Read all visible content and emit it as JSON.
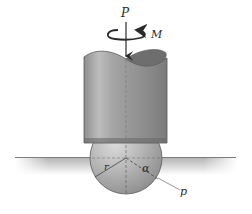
{
  "figure": {
    "labels": {
      "force": "P",
      "moment": "M",
      "radius": "r",
      "angle": "α",
      "pressure": "p"
    },
    "colors": {
      "rod_dark": "#7a7a7a",
      "rod_mid": "#a9a9a9",
      "rod_light": "#c8c8c8",
      "rod_top": "#6f6f6f",
      "sphere": "#b5b5b5",
      "ground": "#9a9a9a",
      "line": "#3a3a3a",
      "background": "#ffffff"
    }
  }
}
